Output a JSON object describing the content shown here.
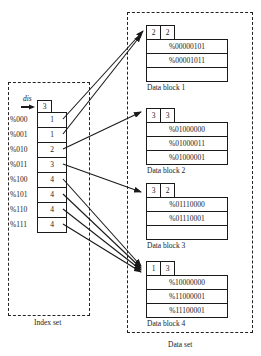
{
  "index_set": {
    "label": "Index set",
    "pointer_label": "dis",
    "depth": "3",
    "rows": [
      {
        "key": "%000",
        "value": "1"
      },
      {
        "key": "%001",
        "value": "1"
      },
      {
        "key": "%010",
        "value": "2"
      },
      {
        "key": "%011",
        "value": "3"
      },
      {
        "key": "%100",
        "value": "4"
      },
      {
        "key": "%101",
        "value": "4"
      },
      {
        "key": "%110",
        "value": "4"
      },
      {
        "key": "%111",
        "value": "4"
      }
    ]
  },
  "data_set": {
    "label": "Data set",
    "blocks": [
      {
        "label": "Data block 1",
        "local_depth": "2",
        "count": "2",
        "records": [
          "%00000101",
          "%00001011",
          ""
        ]
      },
      {
        "label": "Data block 2",
        "local_depth": "3",
        "count": "3",
        "records": [
          "%01000000",
          "%01000011",
          "%01000001"
        ]
      },
      {
        "label": "Data block 3",
        "local_depth": "3",
        "count": "2",
        "records": [
          "%01110000",
          "%01110001",
          ""
        ]
      },
      {
        "label": "Data block 4",
        "local_depth": "1",
        "count": "3",
        "records": [
          "%10000000",
          "%11000001",
          "%11100001"
        ]
      }
    ]
  },
  "colors": {
    "line": "#1a1a1a",
    "background": "#ffffff"
  }
}
